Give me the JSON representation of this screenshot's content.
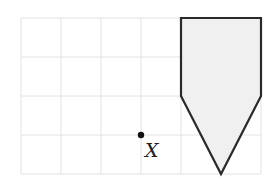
{
  "diagram": {
    "grid": {
      "origin_x": 21,
      "origin_y": 18,
      "cell_size": 40,
      "cell_size_y": 39,
      "columns": 6,
      "rows": 4,
      "line_color": "#e2e2e2"
    },
    "shape": {
      "type": "pentagon",
      "points": [
        [
          4,
          0
        ],
        [
          6,
          0
        ],
        [
          6,
          2
        ],
        [
          5,
          4
        ],
        [
          4,
          2
        ]
      ],
      "fill": "#f0f0f0",
      "stroke": "#2a2a2a"
    },
    "point": {
      "label": "X",
      "grid_x": 3,
      "grid_y": 3
    }
  }
}
